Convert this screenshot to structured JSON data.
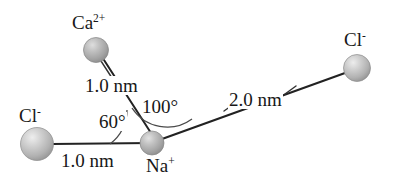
{
  "figure": {
    "background_color": "#ffffff",
    "bond_color": "#222222",
    "arc_color": "#555555"
  },
  "ions": [
    {
      "id": "ca",
      "symbol": "Ca",
      "charge": "2+",
      "label_text": "Ca2+",
      "cx": 96,
      "cy": 50,
      "r": 12.5,
      "fill": "#b4b4b4",
      "highlight": "#dcdcdc",
      "label_x": 72,
      "label_y": 13
    },
    {
      "id": "cl-left",
      "symbol": "Cl",
      "charge": "-",
      "label_text": "Cl-",
      "cx": 37,
      "cy": 144,
      "r": 16.5,
      "fill": "#c2c2c2",
      "highlight": "#e8e8e8",
      "label_x": 19,
      "label_y": 106
    },
    {
      "id": "na",
      "symbol": "Na",
      "charge": "+",
      "label_text": "Na+",
      "cx": 152,
      "cy": 143,
      "r": 12,
      "fill": "#b8b8b8",
      "highlight": "#e0e0e0",
      "label_x": 146,
      "label_y": 156
    },
    {
      "id": "cl-right",
      "symbol": "Cl",
      "charge": "-",
      "label_text": "Cl-",
      "cx": 357,
      "cy": 68,
      "r": 13.5,
      "fill": "#c2c2c2",
      "highlight": "#e8e8e8",
      "label_x": 344,
      "label_y": 30
    }
  ],
  "bonds": [
    {
      "id": "na-cl-left",
      "from": "na",
      "to": "cl-left",
      "distance": "1.0 nm",
      "label_x": 60,
      "label_y": 151
    },
    {
      "id": "na-ca",
      "from": "na",
      "to": "ca",
      "distance": "1.0 nm",
      "label_x": 84,
      "label_y": 76
    },
    {
      "id": "na-cl-right",
      "from": "na",
      "to": "cl-right",
      "distance": "2.0 nm",
      "label_x": 228,
      "label_y": 90
    }
  ],
  "angles": [
    {
      "id": "angle-cl-na-ca",
      "value": "60°",
      "between": [
        "cl-left",
        "ca"
      ],
      "label_x": 98,
      "label_y": 112
    },
    {
      "id": "angle-ca-na-cl-right",
      "value": "100°",
      "between": [
        "ca",
        "cl-right"
      ],
      "label_x": 141,
      "label_y": 97
    }
  ]
}
